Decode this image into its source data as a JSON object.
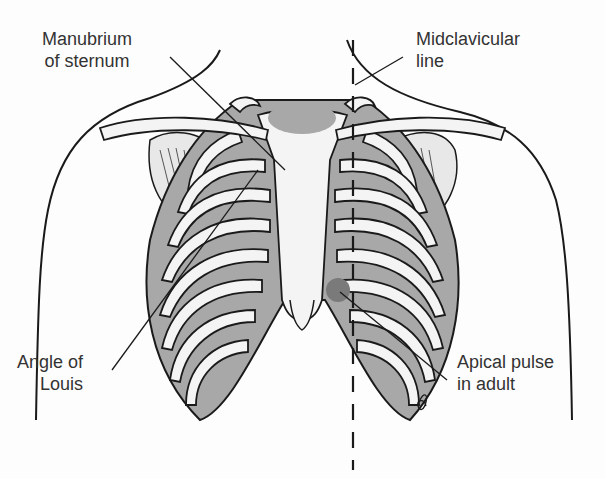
{
  "diagram": {
    "colors": {
      "outline": "#1a1a1a",
      "bone_fill": "#f4f4f4",
      "intercostal_fill": "#a8a8a8",
      "apical_spot": "#7a7a7a",
      "label_text": "#333333",
      "background": "#fdfdfd"
    },
    "labels": {
      "manubrium": {
        "line1": "Manubrium",
        "line2": "of sternum"
      },
      "midclavicular": {
        "line1": "Midclavicular",
        "line2": "line"
      },
      "angle_of_louis": {
        "line1": "Angle of",
        "line2": "Louis"
      },
      "apical_pulse": {
        "line1": "Apical pulse",
        "line2": "in adult"
      }
    },
    "structures": [
      "clavicles",
      "manubrium-of-sternum",
      "sternum-body",
      "xiphoid-process",
      "ribs",
      "costal-cartilages",
      "scapulae",
      "midclavicular-dashed-line",
      "apical-pulse-spot"
    ]
  }
}
